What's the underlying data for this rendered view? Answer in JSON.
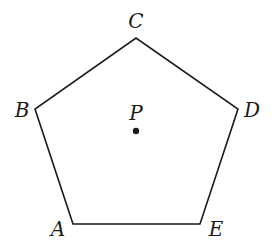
{
  "diagram": {
    "shape": "regular pentagon",
    "stroke_color": "#1a1a1a",
    "vertices": [
      {
        "name": "A",
        "x": 73,
        "y": 224,
        "label_x": 58,
        "label_y": 236
      },
      {
        "name": "B",
        "x": 35,
        "y": 109,
        "label_x": 22,
        "label_y": 117
      },
      {
        "name": "C",
        "x": 136,
        "y": 38,
        "label_x": 136,
        "label_y": 28
      },
      {
        "name": "D",
        "x": 238,
        "y": 109,
        "label_x": 252,
        "label_y": 117
      },
      {
        "name": "E",
        "x": 200,
        "y": 224,
        "label_x": 216,
        "label_y": 236
      }
    ],
    "center_point": {
      "name": "P",
      "x": 136,
      "y": 131,
      "label_x": 136,
      "label_y": 120
    }
  }
}
